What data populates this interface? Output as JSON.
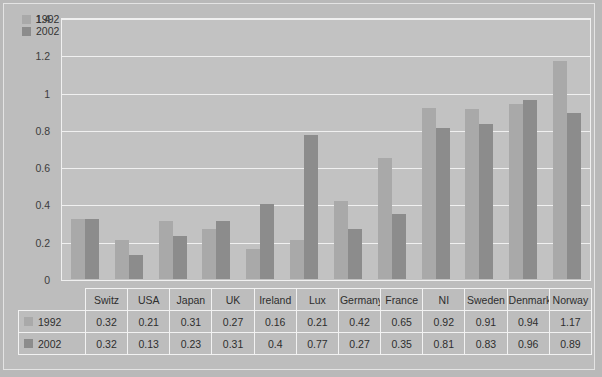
{
  "chart_data": {
    "type": "bar",
    "title": "",
    "xlabel": "",
    "ylabel": "",
    "ylim": [
      0,
      1.4
    ],
    "ytick_labels": [
      "0",
      "0.2",
      "0.4",
      "0.6",
      "0.8",
      "1",
      "1.2",
      "1.4"
    ],
    "ytick_values": [
      0,
      0.2,
      0.4,
      0.6,
      0.8,
      1.0,
      1.2,
      1.4
    ],
    "grid": true,
    "legend_position": "top-left",
    "categories": [
      "Switz",
      "USA",
      "Japan",
      "UK",
      "Ireland",
      "Lux",
      "Germany",
      "France",
      "NI",
      "Sweden",
      "Denmark",
      "Norway"
    ],
    "series": [
      {
        "name": "1992",
        "color": "#a9a9a9",
        "values": [
          0.32,
          0.21,
          0.31,
          0.27,
          0.16,
          0.21,
          0.42,
          0.65,
          0.92,
          0.91,
          0.94,
          1.17
        ]
      },
      {
        "name": "2002",
        "color": "#8c8c8c",
        "values": [
          0.32,
          0.13,
          0.23,
          0.31,
          0.4,
          0.77,
          0.27,
          0.35,
          0.81,
          0.83,
          0.96,
          0.89
        ]
      }
    ]
  },
  "table": {
    "corner_label": "",
    "row_labels": [
      "1992",
      "2002"
    ]
  },
  "colors": {
    "figure_background": "#bdbdbd",
    "plot_background": "#c2c2c2",
    "gridline": "#f0f0f0",
    "series_1992": "#a9a9a9",
    "series_2002": "#8c8c8c",
    "text": "#2e2e2e"
  }
}
